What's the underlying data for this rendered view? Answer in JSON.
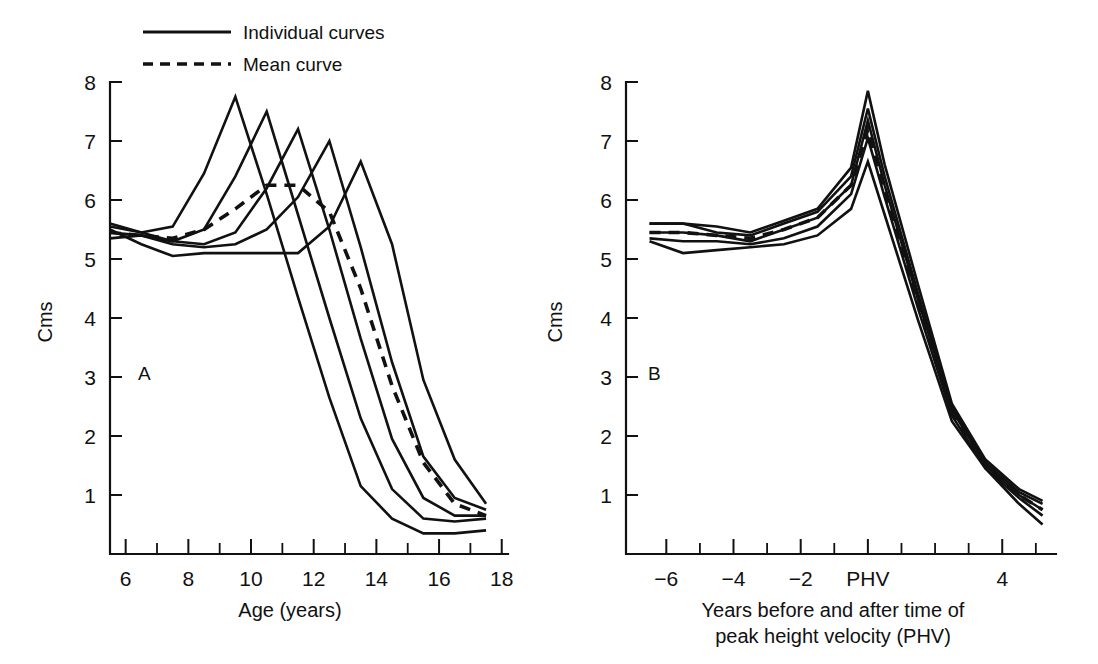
{
  "figure": {
    "background": "#ffffff",
    "ink_color": "#111111"
  },
  "legend": {
    "position": "top-left",
    "items": [
      {
        "label": "Individual curves",
        "style": "solid",
        "name": "legend-individual-curves"
      },
      {
        "label": "Mean curve",
        "style": "dashed",
        "name": "legend-mean-curve"
      }
    ]
  },
  "panels": {
    "a": {
      "label": "A",
      "ylabel": "Cms",
      "xlabel": "Age (years)"
    },
    "b": {
      "label": "B",
      "ylabel": "Cms",
      "xlabel_line1": "Years before and after time of",
      "xlabel_line2": "peak height velocity (PHV)"
    }
  },
  "chart_data": [
    {
      "type": "line",
      "panel": "A",
      "title": "",
      "xlabel": "Age (years)",
      "ylabel": "Cms",
      "xlim": [
        5.5,
        18.2
      ],
      "ylim": [
        0.2,
        8.2
      ],
      "xticks": [
        6,
        8,
        10,
        12,
        14,
        16,
        18
      ],
      "xtick_labels": [
        "6",
        "8",
        "10",
        "12",
        "14",
        "16",
        "18"
      ],
      "xticks_minor": [
        7,
        9,
        11,
        13,
        15,
        17
      ],
      "yticks": [
        1,
        2,
        3,
        4,
        5,
        6,
        7,
        8
      ],
      "ytick_labels": [
        "1",
        "2",
        "3",
        "4",
        "5",
        "6",
        "7",
        "8"
      ],
      "grid": false,
      "legend": "top-left",
      "series": [
        {
          "name": "Individual 1",
          "style": "solid",
          "x": [
            5.5,
            6.5,
            7.5,
            8.5,
            9.5,
            10.5,
            11.5,
            12.5,
            13.5,
            14.5,
            15.5,
            16.5,
            17.5
          ],
          "y": [
            5.55,
            5.45,
            5.55,
            6.45,
            7.75,
            6.1,
            4.35,
            2.65,
            1.15,
            0.6,
            0.35,
            0.35,
            0.4
          ]
        },
        {
          "name": "Individual 2",
          "style": "solid",
          "x": [
            5.5,
            6.5,
            7.5,
            8.5,
            9.5,
            10.5,
            11.5,
            12.5,
            13.5,
            14.5,
            15.5,
            16.5,
            17.5
          ],
          "y": [
            5.35,
            5.4,
            5.3,
            5.5,
            6.4,
            7.5,
            5.75,
            4.0,
            2.3,
            1.1,
            0.6,
            0.55,
            0.6
          ]
        },
        {
          "name": "Individual 3",
          "style": "solid",
          "x": [
            5.5,
            6.5,
            7.5,
            8.5,
            9.5,
            10.5,
            11.5,
            12.5,
            13.5,
            14.5,
            15.5,
            16.5,
            17.5
          ],
          "y": [
            5.6,
            5.45,
            5.3,
            5.25,
            5.45,
            6.2,
            7.2,
            5.5,
            3.65,
            1.95,
            0.95,
            0.65,
            0.65
          ]
        },
        {
          "name": "Individual 4",
          "style": "solid",
          "x": [
            5.5,
            6.5,
            7.5,
            8.5,
            9.5,
            10.5,
            11.5,
            12.5,
            13.5,
            14.5,
            15.5,
            16.5,
            17.5
          ],
          "y": [
            5.45,
            5.4,
            5.25,
            5.2,
            5.25,
            5.5,
            6.05,
            7.0,
            5.2,
            3.25,
            1.65,
            0.95,
            0.75
          ]
        },
        {
          "name": "Individual 5",
          "style": "solid",
          "x": [
            5.5,
            6.5,
            7.5,
            8.5,
            9.5,
            10.5,
            11.5,
            12.5,
            13.5,
            14.5,
            15.5,
            16.5,
            17.5
          ],
          "y": [
            5.5,
            5.25,
            5.05,
            5.1,
            5.1,
            5.1,
            5.1,
            5.55,
            6.65,
            5.25,
            2.95,
            1.6,
            0.85
          ]
        },
        {
          "name": "Mean curve",
          "style": "dashed",
          "x": [
            5.5,
            6.5,
            7.5,
            8.5,
            9.5,
            10.5,
            11.5,
            12.5,
            13.5,
            14.5,
            15.5,
            16.5,
            17.5
          ],
          "y": [
            5.45,
            5.4,
            5.35,
            5.5,
            5.85,
            6.25,
            6.25,
            5.8,
            4.5,
            2.85,
            1.55,
            0.85,
            0.65
          ]
        }
      ]
    },
    {
      "type": "line",
      "panel": "B",
      "title": "",
      "xlabel": "Years before and after time of peak height velocity (PHV)",
      "ylabel": "Cms",
      "xlim": [
        -7.2,
        5.6
      ],
      "ylim": [
        0.2,
        8.2
      ],
      "xticks": [
        -6,
        -4,
        -2,
        0,
        4
      ],
      "xtick_labels": [
        "−6",
        "−4",
        "−2",
        "PHV",
        "4"
      ],
      "xticks_minor": [
        -5,
        -3,
        -1,
        1,
        2,
        3,
        5
      ],
      "yticks": [
        1,
        2,
        3,
        4,
        5,
        6,
        7,
        8
      ],
      "ytick_labels": [
        "1",
        "2",
        "3",
        "4",
        "5",
        "6",
        "7",
        "8"
      ],
      "grid": false,
      "legend": "none",
      "series": [
        {
          "name": "Individual 1",
          "style": "solid",
          "x": [
            -6.5,
            -5.5,
            -4.5,
            -3.5,
            -2.5,
            -1.5,
            -0.5,
            0,
            0.5,
            1.5,
            2.5,
            3.5,
            4.5,
            5.2
          ],
          "y": [
            5.6,
            5.6,
            5.55,
            5.45,
            5.65,
            5.85,
            6.55,
            7.85,
            6.6,
            4.55,
            2.55,
            1.6,
            1.1,
            0.9
          ]
        },
        {
          "name": "Individual 2",
          "style": "solid",
          "x": [
            -6.5,
            -5.5,
            -4.5,
            -3.5,
            -2.5,
            -1.5,
            -0.5,
            0,
            0.5,
            1.5,
            2.5,
            3.5,
            4.5,
            5.2
          ],
          "y": [
            5.6,
            5.6,
            5.45,
            5.4,
            5.6,
            5.8,
            6.4,
            7.55,
            6.4,
            4.4,
            2.5,
            1.55,
            1.05,
            0.85
          ]
        },
        {
          "name": "Individual 3",
          "style": "solid",
          "x": [
            -6.5,
            -5.5,
            -4.5,
            -3.5,
            -2.5,
            -1.5,
            -0.5,
            0,
            0.5,
            1.5,
            2.5,
            3.5,
            4.5,
            5.2
          ],
          "y": [
            5.45,
            5.45,
            5.4,
            5.3,
            5.5,
            5.7,
            6.25,
            7.35,
            6.25,
            4.3,
            2.45,
            1.5,
            1.0,
            0.75
          ]
        },
        {
          "name": "Individual 4",
          "style": "solid",
          "x": [
            -6.5,
            -5.5,
            -4.5,
            -3.5,
            -2.5,
            -1.5,
            -0.5,
            0,
            0.5,
            1.5,
            2.5,
            3.5,
            4.5,
            5.2
          ],
          "y": [
            5.35,
            5.3,
            5.3,
            5.25,
            5.35,
            5.55,
            6.1,
            7.05,
            6.05,
            4.15,
            2.35,
            1.45,
            0.95,
            0.65
          ]
        },
        {
          "name": "Individual 5",
          "style": "solid",
          "x": [
            -6.5,
            -5.5,
            -4.5,
            -3.5,
            -2.5,
            -1.5,
            -0.5,
            0,
            0.5,
            1.5,
            2.5,
            3.5,
            4.5,
            5.2
          ],
          "y": [
            5.3,
            5.1,
            5.15,
            5.2,
            5.25,
            5.4,
            5.85,
            6.65,
            5.75,
            3.95,
            2.25,
            1.45,
            0.85,
            0.5
          ]
        },
        {
          "name": "Mean curve",
          "style": "dashed",
          "x": [
            -6.5,
            -5.5,
            -4.5,
            -3.5,
            -2.5,
            -1.5,
            -0.5,
            0,
            0.5,
            1.5,
            2.5,
            3.5,
            4.5,
            5.2
          ],
          "y": [
            5.45,
            5.45,
            5.4,
            5.35,
            5.5,
            5.7,
            6.25,
            7.2,
            6.15,
            4.25,
            2.4,
            1.5,
            1.0,
            0.75
          ]
        }
      ]
    }
  ]
}
